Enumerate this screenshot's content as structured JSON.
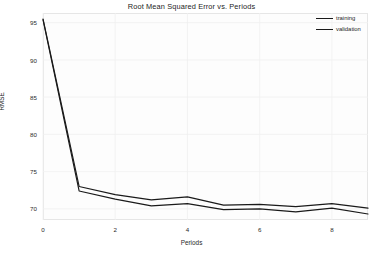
{
  "chart_data": {
    "type": "line",
    "title": "Root Mean Squared Error vs. Periods",
    "xlabel": "Periods",
    "ylabel": "RMSE",
    "x": [
      0,
      1,
      2,
      3,
      4,
      5,
      6,
      7,
      8,
      9
    ],
    "xlim": [
      0,
      9
    ],
    "ylim": [
      68.5,
      96.3
    ],
    "xticks": [
      "0",
      "2",
      "4",
      "6",
      "8"
    ],
    "xtick_values": [
      0,
      2,
      4,
      6,
      8
    ],
    "yticks": [
      "70",
      "75",
      "80",
      "85",
      "90",
      "95"
    ],
    "ytick_values": [
      70,
      75,
      80,
      85,
      90,
      95
    ],
    "grid": true,
    "legend_position": "upper right",
    "series": [
      {
        "name": "training",
        "color": "#1a1a1a",
        "values": [
          95.4,
          72.4,
          71.3,
          70.4,
          70.7,
          69.9,
          70.0,
          69.6,
          70.1,
          69.3
        ]
      },
      {
        "name": "validation",
        "color": "#1a1a1a",
        "values": [
          95.5,
          73.0,
          71.9,
          71.2,
          71.6,
          70.5,
          70.6,
          70.3,
          70.7,
          70.1
        ]
      }
    ]
  }
}
